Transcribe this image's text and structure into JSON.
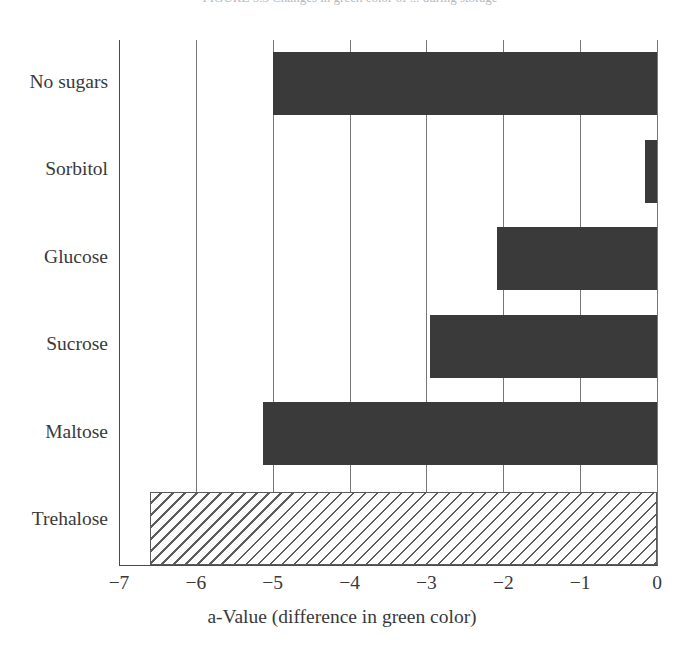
{
  "clipped_caption": {
    "text": "FIGURE 5.3  Changes in green color of ... during storage"
  },
  "chart_data": {
    "type": "bar",
    "orientation": "horizontal",
    "title": "",
    "subtitle": "",
    "xlabel": "a-Value (difference in green color)",
    "ylabel": "",
    "categories": [
      "No sugars",
      "Sorbitol",
      "Glucose",
      "Sucrose",
      "Maltose",
      "Trehalose"
    ],
    "values": [
      -5.0,
      -0.15,
      -2.08,
      -2.95,
      -5.13,
      -6.6
    ],
    "xlim": [
      -7,
      0
    ],
    "xticks": [
      -7,
      -6,
      -5,
      -4,
      -3,
      -2,
      -1,
      0
    ],
    "xticklabels": [
      "−7",
      "−6",
      "−5",
      "−4",
      "−3",
      "−2",
      "−1",
      "0"
    ],
    "grid": "vertical-gridlines-at-xticks",
    "legend": "none",
    "bar_styles": [
      "solid",
      "solid",
      "solid",
      "solid",
      "solid",
      "hatched"
    ],
    "colors": {
      "bar_solid": "#3a3a3a",
      "bar_hatched_fill": "#fdfdfd",
      "bar_hatched_line": "#5d5d5d",
      "axis": "#4a4a4c",
      "gridline": "#77777a",
      "text": "#39393b",
      "background": "#ffffff"
    }
  }
}
